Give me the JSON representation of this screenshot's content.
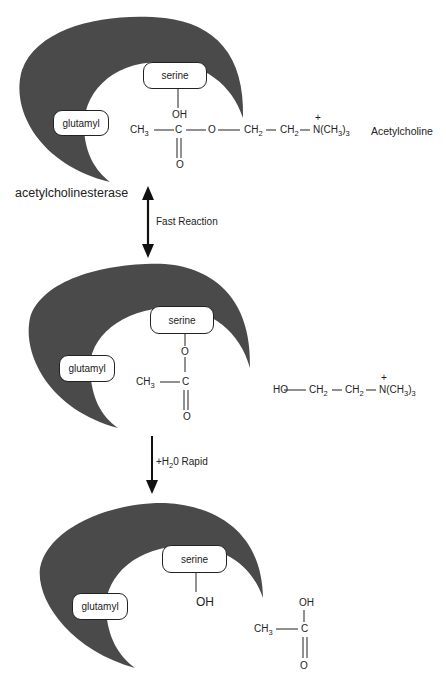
{
  "colors": {
    "enzyme": "#4a4a4a",
    "ink": "#1a1a1a",
    "background": "#ffffff"
  },
  "panel1": {
    "enzyme_label": "acetylcholinesterase",
    "serine": "serine",
    "glutamyl": "glutamyl",
    "oh": "OH",
    "c": "C",
    "o_dbl": "O",
    "ch3": "CH",
    "ch3_sub": "3",
    "ester_o": "O",
    "ch2a": "CH",
    "ch2a_sub": "2",
    "ch2b": "CH",
    "ch2b_sub": "2",
    "n_group": "N(CH",
    "n_sub1": "3",
    "n_close": ")",
    "n_sub2": "3",
    "plus": "+",
    "substrate_label": "Acetylcholine"
  },
  "arrow1": {
    "label": "Fast Reaction",
    "type": "double-headed"
  },
  "panel2": {
    "serine": "serine",
    "glutamyl": "glutamyl",
    "o_link": "O",
    "c": "C",
    "o_dbl": "O",
    "ch3": "CH",
    "ch3_sub": "3",
    "choline": {
      "ho": "HO",
      "ch2a": "CH",
      "ch2a_sub": "2",
      "ch2b": "CH",
      "ch2b_sub": "2",
      "n_group": "N(CH",
      "n_sub1": "3",
      "n_close": ")",
      "n_sub2": "3",
      "plus": "+"
    }
  },
  "arrow2": {
    "label_pre": "+H",
    "label_sub": "2",
    "label_post": "0 Rapid",
    "type": "single-headed-down"
  },
  "panel3": {
    "serine": "serine",
    "glutamyl": "glutamyl",
    "oh": "OH",
    "acetic": {
      "oh": "OH",
      "c": "C",
      "o_dbl": "O",
      "ch3": "CH",
      "ch3_sub": "3"
    }
  }
}
